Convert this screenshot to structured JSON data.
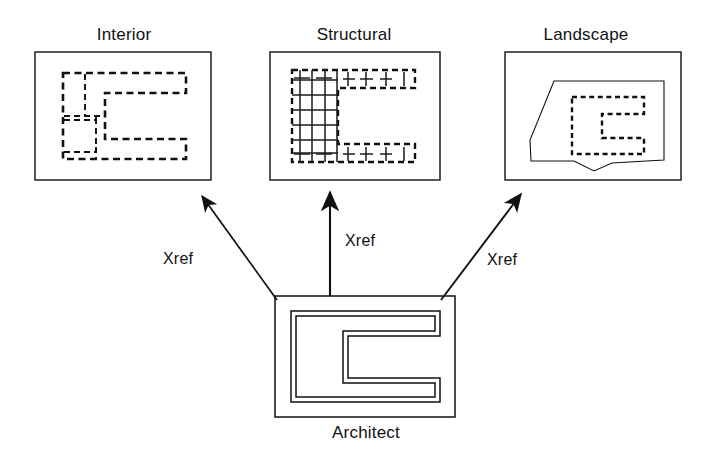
{
  "diagram": {
    "type": "xref-relationship-diagram",
    "stroke_color": "#111111",
    "background": "#ffffff",
    "nodes": [
      {
        "id": "interior",
        "label": "Interior",
        "drawing": "dashed C-shaped floor plan with interior partition walls",
        "line_style": "dashed",
        "box": {
          "x": 35,
          "y": 52,
          "w": 176,
          "h": 128
        }
      },
      {
        "id": "structural",
        "label": "Structural",
        "drawing": "dashed C-shaped outline with solid structural column grid and I-beam symbols",
        "line_style": "dashed-with-solid-grid",
        "box": {
          "x": 270,
          "y": 52,
          "w": 170,
          "h": 128
        }
      },
      {
        "id": "landscape",
        "label": "Landscape",
        "drawing": "solid property-line polygon containing dashed C-shaped building footprint",
        "line_style": "solid-polygon-with-dashed-building",
        "box": {
          "x": 505,
          "y": 52,
          "w": 176,
          "h": 128
        }
      },
      {
        "id": "architect",
        "label": "Architect",
        "drawing": "solid double-line C-shaped wall plan",
        "line_style": "solid-double-line",
        "box": {
          "x": 275,
          "y": 296,
          "w": 180,
          "h": 121
        }
      }
    ],
    "edges": [
      {
        "id": "edge-left",
        "from": "architect",
        "to": "interior",
        "label": "Xref",
        "direction": "up-left"
      },
      {
        "id": "edge-mid",
        "from": "architect",
        "to": "structural",
        "label": "Xref",
        "direction": "up"
      },
      {
        "id": "edge-right",
        "from": "architect",
        "to": "landscape",
        "label": "Xref",
        "direction": "up-right"
      }
    ]
  }
}
